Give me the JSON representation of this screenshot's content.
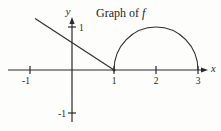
{
  "figure": {
    "title_roman": "Graph of",
    "title_italic": "f"
  },
  "chart_data": {
    "type": "line",
    "title": "Graph of f",
    "xlabel": "x",
    "ylabel": "y",
    "xlim": [
      -1.5,
      3.4
    ],
    "ylim": [
      -1.35,
      1.5
    ],
    "x_ticks": [
      -1,
      1,
      2,
      3
    ],
    "x_tick_labels": [
      "-1",
      "1",
      "2",
      "3"
    ],
    "y_ticks": [
      1,
      -1
    ],
    "y_tick_labels": [
      "1",
      "-1"
    ],
    "grid": false,
    "legend_position": "none",
    "series": [
      {
        "name": "line-segment",
        "shape": "segment",
        "points": [
          [
            -0.88,
            1.2
          ],
          [
            1,
            0
          ]
        ]
      },
      {
        "name": "upper-semicircle",
        "shape": "arc",
        "center": [
          2,
          0
        ],
        "radius": 1,
        "start_point": [
          1,
          0
        ],
        "end_point": [
          3,
          0
        ],
        "half": "upper"
      }
    ],
    "point_marker": [
      1,
      0
    ]
  }
}
